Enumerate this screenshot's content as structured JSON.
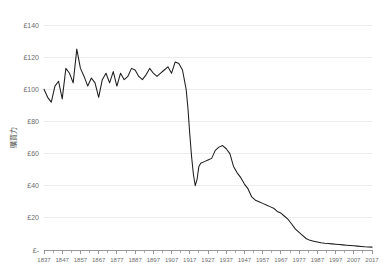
{
  "chart_data": {
    "type": "line",
    "title": "",
    "subtitle": "",
    "xlabel": "",
    "ylabel": "購買力",
    "xlim": [
      1837,
      2017
    ],
    "ylim": [
      0,
      140
    ],
    "grid": true,
    "legend": false,
    "legend_position": "none",
    "y_tick_labels": [
      "£140",
      "£120",
      "£100",
      "£80",
      "£60",
      "£40",
      "£20",
      "£-"
    ],
    "y_tick_values": [
      140,
      120,
      100,
      80,
      60,
      40,
      20,
      0
    ],
    "x_tick_labels": [
      "1837",
      "1847",
      "1857",
      "1867",
      "1877",
      "1887",
      "1897",
      "1907",
      "1917",
      "1927",
      "1937",
      "1947",
      "1957",
      "1967",
      "1977",
      "1987",
      "1997",
      "2007",
      "2017"
    ],
    "x_tick_values": [
      1837,
      1847,
      1857,
      1867,
      1877,
      1887,
      1897,
      1907,
      1917,
      1927,
      1937,
      1947,
      1957,
      1967,
      1977,
      1987,
      1997,
      2007,
      2017
    ],
    "x_minor_interval": 5,
    "series": [
      {
        "name": "購買力",
        "color": "#1d1d1d",
        "x": [
          1837,
          1839,
          1841,
          1843,
          1845,
          1847,
          1849,
          1851,
          1853,
          1855,
          1857,
          1859,
          1861,
          1863,
          1865,
          1867,
          1869,
          1871,
          1873,
          1875,
          1877,
          1879,
          1881,
          1883,
          1885,
          1887,
          1889,
          1891,
          1893,
          1895,
          1897,
          1899,
          1901,
          1903,
          1905,
          1907,
          1909,
          1911,
          1913,
          1915,
          1916,
          1917,
          1918,
          1919,
          1920,
          1921,
          1922,
          1923,
          1925,
          1927,
          1929,
          1931,
          1933,
          1935,
          1937,
          1939,
          1941,
          1943,
          1945,
          1947,
          1949,
          1951,
          1953,
          1955,
          1957,
          1959,
          1961,
          1963,
          1965,
          1967,
          1969,
          1971,
          1973,
          1975,
          1977,
          1979,
          1981,
          1983,
          1985,
          1987,
          1989,
          1991,
          1993,
          1995,
          1997,
          1999,
          2001,
          2003,
          2005,
          2007,
          2009,
          2011,
          2013,
          2015,
          2017
        ],
        "values": [
          100,
          95,
          92,
          102,
          105,
          94,
          113,
          110,
          104,
          125,
          113,
          108,
          102,
          107,
          104,
          95,
          106,
          110,
          104,
          111,
          102,
          110,
          106,
          108,
          113,
          112,
          108,
          106,
          109,
          113,
          110,
          108,
          110,
          112,
          114,
          110,
          117,
          116,
          112,
          100,
          88,
          72,
          58,
          47,
          40,
          44,
          52,
          54,
          55,
          56,
          57,
          62,
          64,
          65,
          63,
          60,
          52,
          48,
          45,
          41,
          38,
          33,
          31,
          30,
          29,
          28,
          27,
          26,
          24,
          23,
          21,
          19,
          16,
          13,
          11,
          9,
          7,
          6,
          5.5,
          5,
          4.5,
          4.2,
          4,
          3.8,
          3.6,
          3.4,
          3.2,
          3,
          2.8,
          2.6,
          2.4,
          2.2,
          2,
          1.9,
          1.8
        ]
      }
    ],
    "annotations": [],
    "currency_symbol": "£",
    "background_color": "#ffffff",
    "gridline_color": "#ededed",
    "axis_color": "#8c8c8c"
  }
}
